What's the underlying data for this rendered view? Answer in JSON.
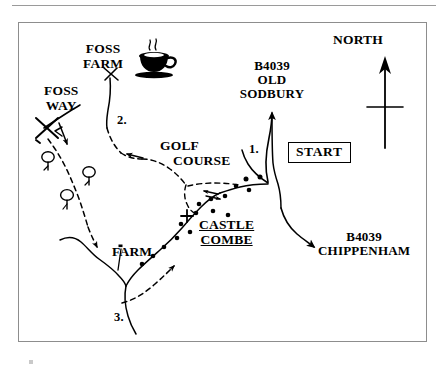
{
  "document": {
    "kind": "hand-drawn walking route map",
    "title": "Castle Combe walking route map"
  },
  "compass": {
    "label": "NORTH",
    "icon": "north-arrow-icon"
  },
  "start_marker": {
    "label": "START"
  },
  "places": [
    {
      "id": "foss-farm",
      "label": "FOSS\nFARM",
      "line1": "FOSS",
      "line2": "FARM"
    },
    {
      "id": "foss-way",
      "label": "FOSS\nWAY",
      "line1": "FOSS",
      "line2": "WAY"
    },
    {
      "id": "golf-course",
      "label": "GOLF\nCOURSE",
      "line1": "GOLF",
      "line2": "COURSE"
    },
    {
      "id": "castle-combe",
      "label": "CASTLE\nCOMBE",
      "line1": "CASTLE",
      "line2": "COMBE"
    },
    {
      "id": "farm",
      "label": "FARM",
      "line1": "FARM",
      "line2": ""
    }
  ],
  "roads": [
    {
      "id": "b4039-old-sodbury",
      "line1": "B4039",
      "line2": "OLD",
      "line3": "SODBURY"
    },
    {
      "id": "b4039-chippenham",
      "line1": "B4039",
      "line2": "CHIPPENHAM",
      "line3": ""
    }
  ],
  "waypoints": [
    {
      "id": "waypoint-1",
      "label": "1."
    },
    {
      "id": "waypoint-2",
      "label": "2."
    },
    {
      "id": "waypoint-3",
      "label": "3."
    }
  ],
  "symbols": [
    {
      "id": "coffee-cup",
      "name": "coffee-cup-icon",
      "meaning": "refreshments at Foss Farm"
    },
    {
      "id": "church-cross",
      "name": "church-cross-icon",
      "meaning": "church at Castle Combe"
    },
    {
      "id": "tree-1",
      "name": "tree-icon",
      "meaning": "woodland"
    },
    {
      "id": "tree-2",
      "name": "tree-icon",
      "meaning": "woodland"
    },
    {
      "id": "tree-3",
      "name": "tree-icon",
      "meaning": "woodland"
    },
    {
      "id": "foss-way-cross",
      "name": "crossing-mark-icon",
      "meaning": "path crossing on Foss Way"
    }
  ],
  "colors": {
    "ink": "#000000",
    "frame": "#8d8d8d",
    "rule": "#9a9a9a",
    "paper": "#ffffff"
  }
}
